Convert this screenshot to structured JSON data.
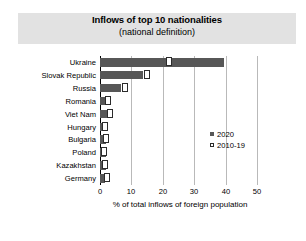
{
  "header": {
    "title": "Inflows of top 10 nationalities",
    "subtitle": "(national definition)"
  },
  "legend": {
    "items": [
      {
        "label": "2020",
        "marker": "filled-square",
        "color": "#575757"
      },
      {
        "label": "2010-19",
        "marker": "open-square",
        "color": "#ffffff"
      }
    ]
  },
  "axis": {
    "ticks": [
      "0",
      "10",
      "20",
      "30",
      "40",
      "50"
    ],
    "xlabel": "% of total inflows of foreign population"
  },
  "chart_data": {
    "type": "bar",
    "orientation": "horizontal",
    "title": "Inflows of top 10 nationalities",
    "subtitle": "(national definition)",
    "categories": [
      "Ukraine",
      "Slovak Republic",
      "Russia",
      "Romania",
      "Viet Nam",
      "Hungary",
      "Bulgaria",
      "Poland",
      "Kazakhstan",
      "Germany"
    ],
    "series": [
      {
        "name": "2020",
        "marker": "filled-square",
        "color": "#575757",
        "values": [
          39.5,
          13.7,
          6.7,
          2.9,
          2.5,
          2.0,
          1.9,
          1.9,
          1.9,
          1.7
        ]
      },
      {
        "name": "2010-19",
        "marker": "open-square",
        "color": "#ffffff",
        "values": [
          23.0,
          16.0,
          8.8,
          3.5,
          4.2,
          2.6,
          3.0,
          2.2,
          2.4,
          3.2
        ]
      }
    ],
    "xlabel": "% of total inflows of foreign population",
    "ylabel": "",
    "xlim": [
      0,
      50
    ],
    "xticks": [
      0,
      10,
      20,
      30,
      40,
      50
    ],
    "grid": "vertical",
    "legend_position": "inside-right"
  }
}
